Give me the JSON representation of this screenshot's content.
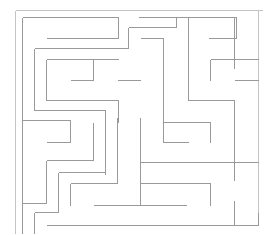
{
  "image": {
    "type": "maze",
    "background": "#ffffff",
    "wall_color": "#9a9a9a",
    "outer_wall_color": "#c4c4c4"
  },
  "maze": {
    "outer": [
      [
        15,
        10,
        262,
        10
      ],
      [
        15,
        10,
        15,
        234
      ],
      [
        258,
        10,
        258,
        212
      ]
    ],
    "walls": [
      [
        22,
        17,
        118,
        17
      ],
      [
        22,
        17,
        22,
        234
      ],
      [
        118,
        17,
        118,
        38
      ],
      [
        46,
        38,
        118,
        38
      ],
      [
        128,
        27,
        128,
        48
      ],
      [
        128,
        27,
        176,
        27
      ],
      [
        176,
        17,
        176,
        27
      ],
      [
        138,
        17,
        236,
        17
      ],
      [
        188,
        17,
        188,
        100
      ],
      [
        188,
        17,
        236,
        17
      ],
      [
        236,
        17,
        236,
        38
      ],
      [
        208,
        38,
        236,
        38
      ],
      [
        234,
        17,
        234,
        68
      ],
      [
        34,
        48,
        128,
        48
      ],
      [
        34,
        48,
        34,
        110
      ],
      [
        46,
        59,
        118,
        59
      ],
      [
        46,
        59,
        46,
        100
      ],
      [
        93,
        59,
        93,
        80
      ],
      [
        70,
        80,
        93,
        80
      ],
      [
        117,
        80,
        140,
        80
      ],
      [
        140,
        38,
        163,
        38
      ],
      [
        163,
        38,
        163,
        122
      ],
      [
        46,
        100,
        118,
        100
      ],
      [
        118,
        100,
        118,
        122
      ],
      [
        34,
        110,
        105,
        110
      ],
      [
        105,
        110,
        105,
        174
      ],
      [
        22,
        120,
        70,
        120
      ],
      [
        70,
        120,
        70,
        142
      ],
      [
        46,
        142,
        70,
        142
      ],
      [
        210,
        59,
        258,
        59
      ],
      [
        210,
        59,
        210,
        80
      ],
      [
        234,
        80,
        258,
        80
      ],
      [
        188,
        100,
        234,
        100
      ],
      [
        234,
        100,
        234,
        180
      ],
      [
        163,
        122,
        210,
        122
      ],
      [
        210,
        122,
        210,
        142
      ],
      [
        163,
        142,
        188,
        142
      ],
      [
        163,
        122,
        163,
        142
      ],
      [
        93,
        122,
        93,
        160
      ],
      [
        46,
        160,
        93,
        160
      ],
      [
        46,
        160,
        46,
        203
      ],
      [
        22,
        203,
        46,
        203
      ],
      [
        58,
        172,
        105,
        172
      ],
      [
        58,
        172,
        58,
        212
      ],
      [
        70,
        183,
        117,
        183
      ],
      [
        70,
        183,
        70,
        205
      ],
      [
        117,
        117,
        117,
        183
      ],
      [
        140,
        117,
        140,
        205
      ],
      [
        140,
        162,
        258,
        162
      ],
      [
        140,
        183,
        210,
        183
      ],
      [
        210,
        183,
        210,
        205
      ],
      [
        93,
        205,
        186,
        205
      ],
      [
        234,
        200,
        234,
        225
      ],
      [
        34,
        212,
        58,
        212
      ],
      [
        34,
        212,
        34,
        234
      ],
      [
        46,
        225,
        258,
        225
      ],
      [
        258,
        212,
        258,
        225
      ]
    ]
  }
}
